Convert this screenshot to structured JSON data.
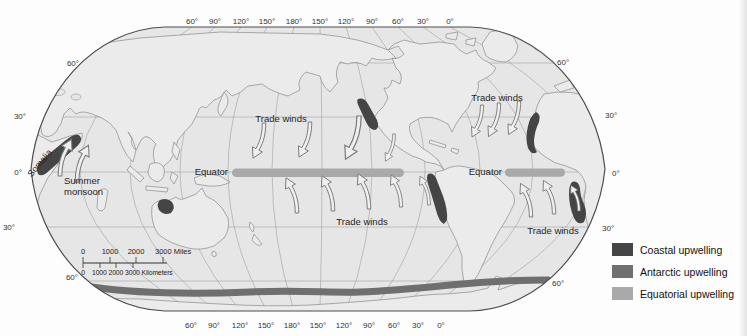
{
  "axis": {
    "top": [
      "60°",
      "90°",
      "120°",
      "150°",
      "180°",
      "150°",
      "120°",
      "90°",
      "60°",
      "30°",
      "0°"
    ],
    "bottom": [
      "60°",
      "90°",
      "120°",
      "150°",
      "180°",
      "150°",
      "120°",
      "90°",
      "60°",
      "30°",
      "0°"
    ],
    "left": [
      "60°",
      "30°",
      "0°",
      "30°",
      "60°"
    ],
    "right": [
      "60°",
      "30°",
      "0°",
      "30°",
      "60°"
    ]
  },
  "labels": {
    "equator": "Equator",
    "trade_winds": "Trade winds",
    "somalia": "Somalia",
    "summer_monsoon_1": "Summer",
    "summer_monsoon_2": "monsoon"
  },
  "scale_bar": {
    "miles": [
      "0",
      "1000",
      "2000",
      "3000 Miles"
    ],
    "kilometers_zero": "0",
    "kilometers": "1000 2000 3000 Kilometers"
  },
  "legend": {
    "items": [
      {
        "label": "Coastal upwelling",
        "color": "#454545"
      },
      {
        "label": "Antarctic upwelling",
        "color": "#6f6f6f"
      },
      {
        "label": "Equatorial upwelling",
        "color": "#a9a9a9"
      }
    ]
  }
}
